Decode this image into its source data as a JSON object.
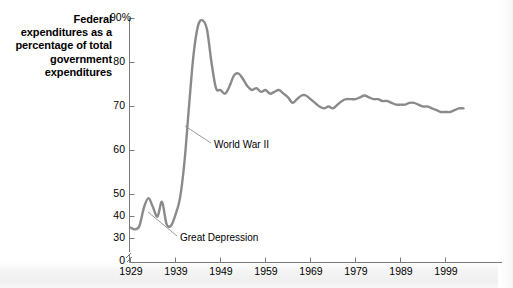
{
  "figure": {
    "axis_title": "Federal expenditures as a percentage of total government expenditures",
    "line_color": "#8a8a8a",
    "axis_color": "#7a7a7a",
    "text_color": "#000000",
    "background": "#ffffff"
  },
  "chart_data": {
    "type": "line",
    "title": "Federal expenditures as a percentage of total government expenditures",
    "xlabel": "",
    "ylabel": "Federal expenditures as a percentage of total government expenditures",
    "xlim": [
      1929,
      2004
    ],
    "ylim": [
      28,
      92
    ],
    "y_axis_break": true,
    "y_axis_break_value": 0,
    "grid": false,
    "legend": "none",
    "ytick_labels": [
      "90%",
      "80",
      "70",
      "60",
      "50",
      "40",
      "30",
      "0"
    ],
    "ytick_values": [
      90,
      80,
      70,
      60,
      50,
      40,
      30,
      0
    ],
    "xtick_labels": [
      "1929",
      "1939",
      "1949",
      "1959",
      "1969",
      "1979",
      "1989",
      "1999"
    ],
    "xtick_values": [
      1929,
      1939,
      1949,
      1959,
      1969,
      1979,
      1989,
      1999
    ],
    "series": [
      {
        "name": "Federal share of total government expenditures",
        "x": [
          1929,
          1930,
          1931,
          1932,
          1933,
          1934,
          1935,
          1936,
          1937,
          1938,
          1939,
          1940,
          1941,
          1942,
          1943,
          1944,
          1945,
          1946,
          1947,
          1948,
          1949,
          1950,
          1951,
          1952,
          1953,
          1954,
          1955,
          1956,
          1957,
          1958,
          1959,
          1960,
          1961,
          1962,
          1963,
          1964,
          1965,
          1966,
          1967,
          1968,
          1969,
          1970,
          1971,
          1972,
          1973,
          1974,
          1975,
          1976,
          1977,
          1978,
          1979,
          1980,
          1981,
          1982,
          1983,
          1984,
          1985,
          1986,
          1987,
          1988,
          1989,
          1990,
          1991,
          1992,
          1993,
          1994,
          1995,
          1996,
          1997,
          1998,
          1999,
          2000,
          2001,
          2002,
          2003
        ],
        "values": [
          33,
          32.5,
          33.5,
          38.5,
          41,
          38.5,
          36,
          40,
          34,
          33.5,
          36.5,
          41,
          51,
          66,
          80,
          88,
          89.5,
          87,
          78,
          71,
          70.5,
          69.5,
          71.5,
          74.5,
          75,
          73.5,
          71.5,
          70.5,
          71,
          70,
          70.5,
          69.5,
          70,
          70.5,
          69.5,
          68.5,
          67,
          68,
          69,
          69,
          68,
          67,
          66,
          65.5,
          66,
          65.5,
          66.5,
          67.5,
          68,
          68,
          68,
          68.5,
          69,
          68.5,
          68,
          68,
          67.5,
          67.5,
          67,
          66.5,
          66.5,
          66.5,
          67,
          67,
          66.5,
          66,
          66,
          65.5,
          65,
          64.5,
          64.5,
          64.5,
          65,
          65.5,
          65.5
        ]
      }
    ],
    "annotations": [
      {
        "label": "World War II",
        "x_value": 1941,
        "y_value": 52
      },
      {
        "label": "Great Depression",
        "x_value": 1933,
        "y_value": 30
      }
    ]
  }
}
